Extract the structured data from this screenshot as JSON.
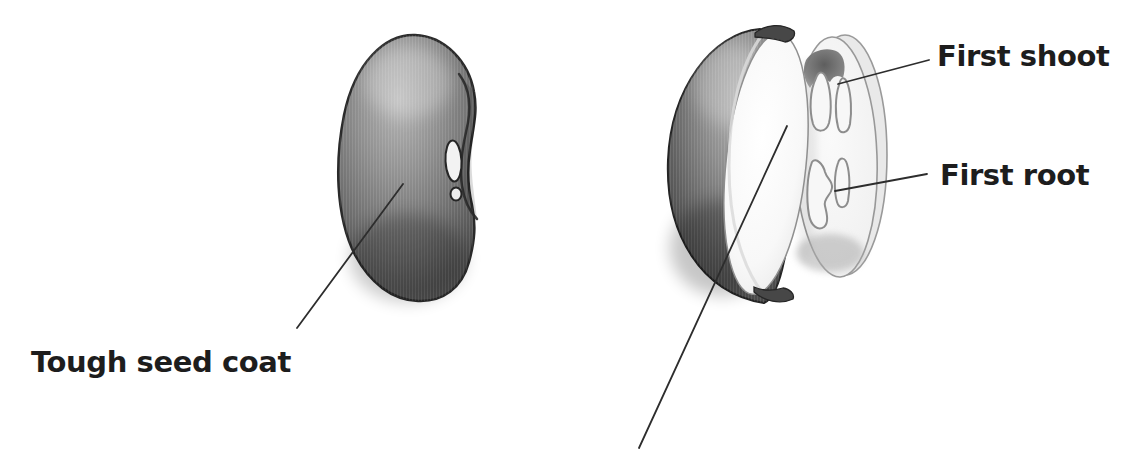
{
  "figure": {
    "background": "#ffffff",
    "labels": {
      "seed_coat": "Tough seed coat",
      "first_shoot": "First shoot",
      "first_root": "First root"
    },
    "colors": {
      "ink": "#1d1d1d",
      "leader_line": "#2d2d2d",
      "seed_dark": "#383838",
      "seed_highlight": "#b4b4b4",
      "cotyledon_white": "#fdfdfd",
      "half_face": "#f4f4f4",
      "outline_gray": "#949494"
    }
  }
}
